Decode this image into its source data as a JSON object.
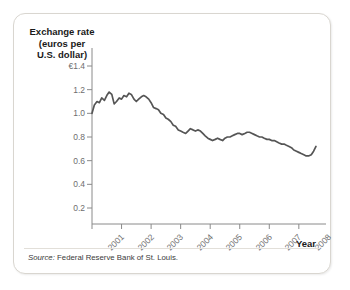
{
  "figure": {
    "y_axis_title": "Exchange rate\n(euros per\nU.S. dollar)",
    "x_axis_title": "Year",
    "source_label": "Source:",
    "source_text": " Federal Reserve Bank of St. Louis.",
    "line_color": "#555555",
    "axis_color": "#8a8a8a",
    "border_color": "#d9d6d0"
  },
  "chart_data": {
    "type": "line",
    "title": "",
    "subtitle": "",
    "xlabel": "Year",
    "ylabel": "Exchange rate (euros per U.S. dollar)",
    "currency_symbol": "€",
    "grid": false,
    "legend": "none",
    "xlim": [
      2001.0,
      2008.75
    ],
    "ylim": [
      0.0,
      1.5
    ],
    "ytick_labels": [
      "€1.4",
      "1.2",
      "1.0",
      "0.8",
      "0.6",
      "0.4",
      "0.2"
    ],
    "yticks": [
      1.4,
      1.2,
      1.0,
      0.8,
      0.6,
      0.4,
      0.2
    ],
    "xtick_labels": [
      "2001",
      "2002",
      "2003",
      "2004",
      "2005",
      "2006",
      "2007",
      "2008"
    ],
    "xticks": [
      2001,
      2002,
      2003,
      2004,
      2005,
      2006,
      2007,
      2008
    ],
    "series": [
      {
        "name": "Euros per U.S. dollar",
        "x": [
          2001.0,
          2001.08,
          2001.17,
          2001.25,
          2001.33,
          2001.42,
          2001.5,
          2001.58,
          2001.67,
          2001.75,
          2001.83,
          2001.92,
          2002.0,
          2002.08,
          2002.17,
          2002.25,
          2002.33,
          2002.42,
          2002.5,
          2002.58,
          2002.67,
          2002.75,
          2002.83,
          2002.92,
          2003.0,
          2003.08,
          2003.17,
          2003.25,
          2003.33,
          2003.42,
          2003.5,
          2003.58,
          2003.67,
          2003.75,
          2003.83,
          2003.92,
          2004.0,
          2004.08,
          2004.17,
          2004.25,
          2004.33,
          2004.42,
          2004.5,
          2004.58,
          2004.67,
          2004.75,
          2004.83,
          2004.92,
          2005.0,
          2005.08,
          2005.17,
          2005.25,
          2005.33,
          2005.42,
          2005.5,
          2005.58,
          2005.67,
          2005.75,
          2005.83,
          2005.92,
          2006.0,
          2006.08,
          2006.17,
          2006.25,
          2006.33,
          2006.42,
          2006.5,
          2006.58,
          2006.67,
          2006.75,
          2006.83,
          2006.92,
          2007.0,
          2007.08,
          2007.17,
          2007.25,
          2007.33,
          2007.42,
          2007.5,
          2007.58,
          2007.67,
          2007.75,
          2007.83,
          2007.92,
          2008.0,
          2008.08,
          2008.17,
          2008.25,
          2008.33,
          2008.42,
          2008.5,
          2008.58
        ],
        "values": [
          1.0,
          1.07,
          1.1,
          1.09,
          1.13,
          1.11,
          1.15,
          1.18,
          1.16,
          1.08,
          1.1,
          1.13,
          1.12,
          1.15,
          1.14,
          1.17,
          1.16,
          1.12,
          1.1,
          1.12,
          1.14,
          1.15,
          1.14,
          1.12,
          1.09,
          1.05,
          1.04,
          1.03,
          1.0,
          0.99,
          0.96,
          0.95,
          0.93,
          0.9,
          0.89,
          0.86,
          0.85,
          0.84,
          0.83,
          0.85,
          0.87,
          0.86,
          0.85,
          0.86,
          0.85,
          0.83,
          0.81,
          0.79,
          0.78,
          0.77,
          0.78,
          0.79,
          0.78,
          0.77,
          0.79,
          0.8,
          0.8,
          0.81,
          0.82,
          0.83,
          0.83,
          0.82,
          0.83,
          0.84,
          0.84,
          0.83,
          0.82,
          0.81,
          0.8,
          0.8,
          0.79,
          0.78,
          0.78,
          0.77,
          0.77,
          0.76,
          0.75,
          0.74,
          0.74,
          0.73,
          0.72,
          0.71,
          0.69,
          0.68,
          0.67,
          0.66,
          0.65,
          0.64,
          0.64,
          0.65,
          0.68,
          0.72
        ]
      }
    ]
  }
}
